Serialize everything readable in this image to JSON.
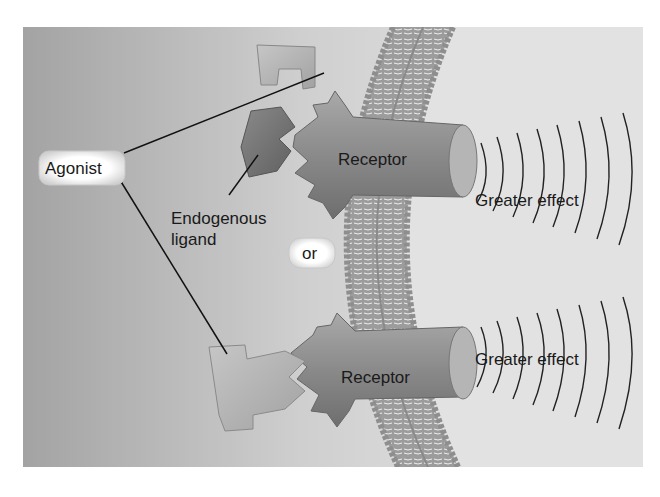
{
  "labels": {
    "agonist": "Agonist",
    "endogenous_line1": "Endogenous",
    "endogenous_line2": "ligand",
    "or": "or",
    "receptor_top": "Receptor",
    "receptor_bottom": "Receptor",
    "effect_top": "Greater effect",
    "effect_bottom": "Greater effect"
  },
  "colors": {
    "background_left": "#9a9a9a",
    "background_right": "#e6e6e6",
    "cell_interior": "#dcdcdc",
    "receptor": "#8c8c8c",
    "agonist_shape": "#b3b3b3",
    "endogenous_ligand": "#7a7a7a",
    "membrane_head": "#a8a8a8",
    "line": "#111111"
  }
}
